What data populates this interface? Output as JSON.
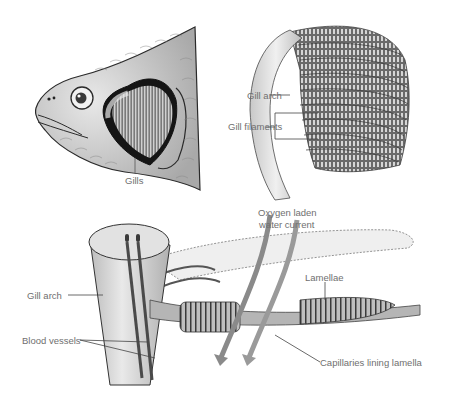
{
  "figure": {
    "panels": [
      {
        "id": "fish-head",
        "labels": [
          "Gills"
        ]
      },
      {
        "id": "gill-arch-detail",
        "labels": [
          "Gill arch",
          "Gill filaments"
        ]
      },
      {
        "id": "filament-cross-section",
        "labels": [
          "Oxygen laden",
          "water current",
          "Lamellae",
          "Gill arch",
          "Blood vessels",
          "Capillaries lining lamella"
        ]
      }
    ]
  },
  "labels": {
    "gills": "Gills",
    "gill_arch_top": "Gill arch",
    "gill_filaments": "Gill filaments",
    "oxygen_line1": "Oxygen laden",
    "oxygen_line2": "water current",
    "lamellae": "Lamellae",
    "gill_arch_bottom": "Gill arch",
    "blood_vessels": "Blood vessels",
    "capillaries": "Capillaries lining lamella"
  },
  "colors": {
    "background": "#ffffff",
    "ink": "#2a2a2a",
    "label_text": "#6f6f6f",
    "arch_fill": "#e6e6e6",
    "vessel": "#4a4a4a",
    "arrow": "#808080"
  }
}
